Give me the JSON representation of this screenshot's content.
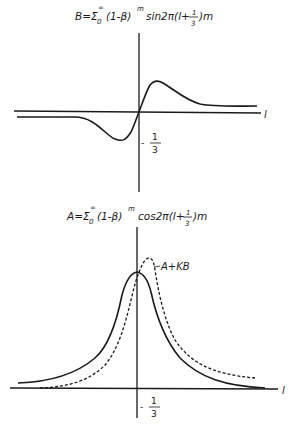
{
  "top_plot": {
    "formula": {
      "lhs": "B=Σ",
      "sub": "0",
      "sup": "∞",
      "body1": "(1-β)",
      "exp": "m",
      "body2": "sin2π(l+",
      "frac_num": "1",
      "frac_den": "3",
      "body3": ")m"
    },
    "x_axis_label": "l",
    "tick_label": {
      "sign": "-",
      "num": "1",
      "den": "3"
    },
    "curve": "B (dispersion-like, antisymmetric)"
  },
  "bottom_plot": {
    "formula": {
      "lhs": "A=Σ",
      "sub": "0",
      "sup": "∞",
      "body1": "(1-β)",
      "exp": "m",
      "body2": "cos2π(l+",
      "frac_num": "1",
      "frac_den": "3",
      "body3": ")m"
    },
    "x_axis_label": "l",
    "tick_label": {
      "sign": "-",
      "num": "1",
      "den": "3"
    },
    "curve_label": "A+KB",
    "curves": [
      "A (solid, symmetric peak)",
      "A+KB (dashed, shifted peak)"
    ]
  }
}
